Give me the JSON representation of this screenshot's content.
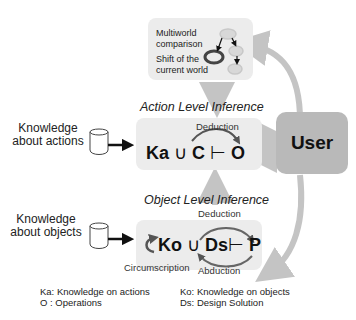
{
  "top_box": {
    "multiworld_label": "Multiworld comparison",
    "shift_label": "Shift of the current world"
  },
  "action_level": {
    "title": "Action Level Inference",
    "deduction_label": "Deduction",
    "formula": {
      "ka": "Ka",
      "union": "∪",
      "c": "C",
      "turnstile": "⊢",
      "o": "O"
    },
    "source_label": "Knowledge about actions"
  },
  "object_level": {
    "title": "Object Level Inference",
    "deduction_label": "Deduction",
    "circumscription_label": "Circumscription",
    "abduction_label": "Abduction",
    "formula": {
      "ko": "Ko",
      "union": "∪",
      "ds": "Ds",
      "turnstile": "⊢",
      "p": "P"
    },
    "source_label": "Knowledge about objects"
  },
  "user": {
    "label": "User"
  },
  "legend": {
    "ka": "Ka: Knowledge on actions",
    "o": "O : Operations",
    "ko": "Ko: Knowledge on objects",
    "ds": "Ds: Design Solution"
  },
  "colors": {
    "box_fill": "#ececec",
    "user_fill": "#b9b9b9",
    "arrow_gray": "#c4c4c4",
    "ellipse_light": "#d8d8d8",
    "ellipse_dark": "#444444"
  }
}
